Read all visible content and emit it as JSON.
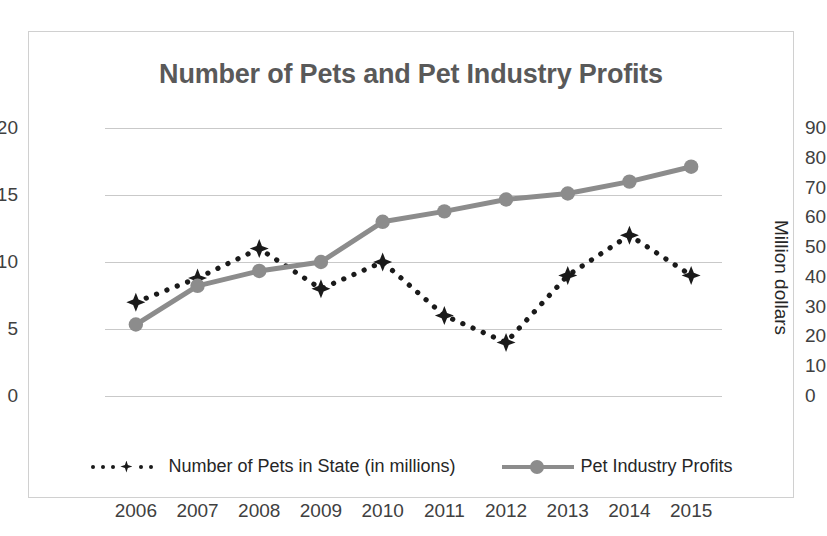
{
  "chart_data": {
    "type": "line",
    "title": "Number of Pets and Pet Industry Profits",
    "xlabel": "",
    "ylabel": "",
    "y2label": "Million dollars",
    "categories": [
      "2006",
      "2007",
      "2008",
      "2009",
      "2010",
      "2011",
      "2012",
      "2013",
      "2014",
      "2015"
    ],
    "yticks_left": [
      0,
      5,
      10,
      15,
      20
    ],
    "yticks_right": [
      0,
      10,
      20,
      30,
      40,
      50,
      60,
      70,
      80,
      90
    ],
    "ylim": [
      0,
      20
    ],
    "y2lim": [
      0,
      90
    ],
    "grid": true,
    "legend_position": "bottom",
    "series": [
      {
        "name": "Number of Pets in State  (in millions)",
        "axis": "left",
        "style": "dotted",
        "marker": "star",
        "color": "#1a1a1a",
        "values": [
          7,
          8.8,
          11,
          8,
          10,
          6,
          4,
          9,
          12,
          9
        ]
      },
      {
        "name": "Pet Industry Profits",
        "axis": "right",
        "style": "solid",
        "marker": "circle",
        "color": "#8c8c8c",
        "values": [
          24,
          37,
          42,
          45,
          58.5,
          62,
          66,
          68,
          72,
          77
        ]
      }
    ]
  },
  "legend": {
    "entry_pets": "Number of Pets in State  (in millions)",
    "entry_profits": "Pet Industry Profits"
  }
}
